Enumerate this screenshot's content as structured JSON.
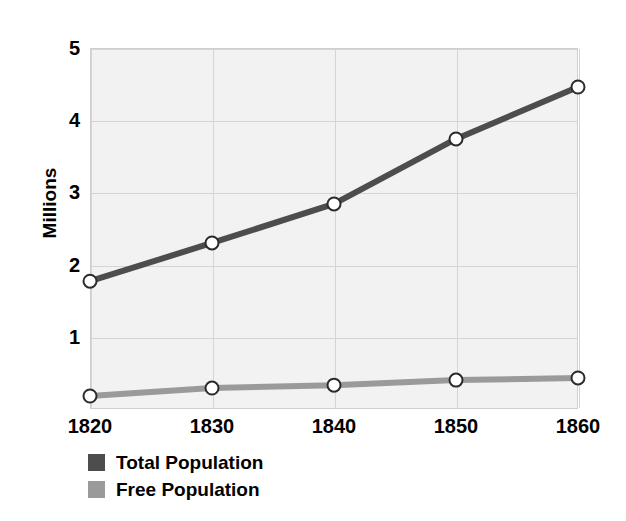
{
  "chart_data": {
    "type": "line",
    "title": "",
    "xlabel": "",
    "ylabel": "Millions",
    "categories": [
      "1820",
      "1830",
      "1840",
      "1850",
      "1860"
    ],
    "x": [
      1820,
      1830,
      1840,
      1850,
      1860
    ],
    "xlim": [
      1820,
      1860
    ],
    "ylim": [
      0,
      5
    ],
    "y_ticks": [
      "1",
      "2",
      "3",
      "4",
      "5"
    ],
    "y_tick_values": [
      1,
      2,
      3,
      4,
      5
    ],
    "grid": true,
    "legend_position": "bottom-left",
    "marker": "open-circle",
    "series": [
      {
        "name": "Total Population",
        "color": "#4d4d4d",
        "values": [
          1.77,
          2.3,
          2.84,
          3.74,
          4.46
        ]
      },
      {
        "name": "Free Population",
        "color": "#9a9a9a",
        "values": [
          0.18,
          0.29,
          0.33,
          0.4,
          0.43
        ]
      }
    ]
  },
  "axes": {
    "y_title": "Millions"
  },
  "legend": {
    "items": [
      {
        "label": "Total Population",
        "color": "#4d4d4d"
      },
      {
        "label": "Free Population",
        "color": "#9a9a9a"
      }
    ]
  },
  "colors": {
    "plot_background": "#f2f2f2",
    "gridline": "#d5d5d5",
    "axis_text": "#000000",
    "marker_fill": "#ffffff"
  }
}
